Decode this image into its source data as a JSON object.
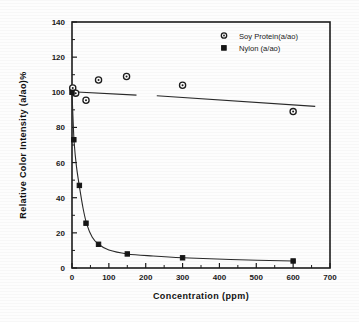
{
  "chart_data": {
    "type": "scatter",
    "title": "",
    "xlabel": "Concentration (ppm)",
    "ylabel": "Relative  Color  Intensity  (a/ao)%",
    "xlim": [
      0,
      700
    ],
    "ylim": [
      0,
      140
    ],
    "xticks": [
      0,
      100,
      200,
      300,
      400,
      500,
      600,
      700
    ],
    "yticks": [
      0,
      20,
      40,
      60,
      80,
      100,
      120,
      140
    ],
    "x_minor_step": 50,
    "y_minor_step": 10,
    "grid": false,
    "legend_position": "upper-right-inside",
    "series": [
      {
        "name": "Soy Protein(a/ao)",
        "marker": "open-circle",
        "points": [
          {
            "x": 2,
            "y": 102.5
          },
          {
            "x": 10,
            "y": 99.5
          },
          {
            "x": 38,
            "y": 95.5
          },
          {
            "x": 72,
            "y": 107.0
          },
          {
            "x": 148,
            "y": 109.0
          },
          {
            "x": 300,
            "y": 104.0
          },
          {
            "x": 600,
            "y": 89.0
          }
        ],
        "trend_line": [
          {
            "x": 0,
            "y": 100.3
          },
          {
            "x": 175,
            "y": 98.4
          },
          {
            "x": 230,
            "y": 98.0
          },
          {
            "x": 660,
            "y": 92.0
          }
        ],
        "trend_line_gap": {
          "from_x": 175,
          "to_x": 230
        }
      },
      {
        "name": "Nylon (a/ao)",
        "marker": "filled-square",
        "points": [
          {
            "x": 0,
            "y": 100.0
          },
          {
            "x": 5,
            "y": 73.0
          },
          {
            "x": 20,
            "y": 47.0
          },
          {
            "x": 38,
            "y": 25.5
          },
          {
            "x": 72,
            "y": 13.5
          },
          {
            "x": 150,
            "y": 8.0
          },
          {
            "x": 300,
            "y": 5.8
          },
          {
            "x": 600,
            "y": 4.0
          }
        ],
        "fit_curve": [
          {
            "x": 0,
            "y": 100.0
          },
          {
            "x": 3,
            "y": 84.0
          },
          {
            "x": 6,
            "y": 71.0
          },
          {
            "x": 12,
            "y": 58.0
          },
          {
            "x": 20,
            "y": 46.5
          },
          {
            "x": 30,
            "y": 34.0
          },
          {
            "x": 40,
            "y": 25.0
          },
          {
            "x": 55,
            "y": 17.5
          },
          {
            "x": 72,
            "y": 13.5
          },
          {
            "x": 100,
            "y": 10.2
          },
          {
            "x": 150,
            "y": 8.0
          },
          {
            "x": 220,
            "y": 6.8
          },
          {
            "x": 300,
            "y": 5.8
          },
          {
            "x": 430,
            "y": 4.8
          },
          {
            "x": 600,
            "y": 4.0
          }
        ]
      }
    ]
  },
  "legend": {
    "entries": [
      {
        "label": "Soy Protein(a/ao)",
        "marker": "open-circle"
      },
      {
        "label": "Nylon (a/ao)",
        "marker": "filled-square"
      }
    ]
  },
  "axes": {
    "x_title": "Concentration (ppm)",
    "y_title": "Relative  Color  Intensity  (a/ao)%",
    "x_tick_labels": [
      "0",
      "100",
      "200",
      "300",
      "400",
      "500",
      "600",
      "700"
    ],
    "y_tick_labels": [
      "0",
      "20",
      "40",
      "60",
      "80",
      "100",
      "120",
      "140"
    ]
  },
  "colors": {
    "ink": "#1c1c1c",
    "background": "#fdfdfd",
    "marker_fill_open": "#ffffff",
    "marker_fill_closed": "#161616"
  }
}
